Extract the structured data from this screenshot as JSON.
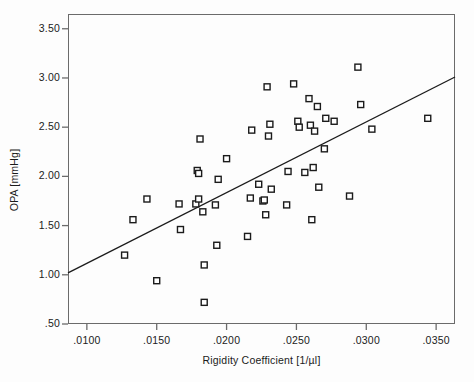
{
  "chart_data": {
    "type": "scatter",
    "title": "",
    "xlabel": "Rigidity Coefficient [1/µl]",
    "ylabel": "OPA [mmHg]",
    "xlim": [
      0.00865,
      0.03635
    ],
    "ylim": [
      0.5,
      3.65
    ],
    "xticks": [
      0.01,
      0.015,
      0.02,
      0.025,
      0.03,
      0.035
    ],
    "xtick_labels": [
      ".0100",
      ".0150",
      ".0200",
      ".0250",
      ".0300",
      ".0350"
    ],
    "yticks": [
      0.5,
      1.0,
      1.5,
      2.0,
      2.5,
      3.0,
      3.5
    ],
    "ytick_labels": [
      ".50",
      "1.00",
      "1.50",
      "2.00",
      "2.50",
      "3.00",
      "3.50"
    ],
    "grid": false,
    "legend": null,
    "marker": {
      "shape": "square-open",
      "size": 6,
      "edge_color": "#1b1b1b",
      "face_color": "#ffffff"
    },
    "points": [
      {
        "x": 0.0127,
        "y": 1.2
      },
      {
        "x": 0.0133,
        "y": 1.56
      },
      {
        "x": 0.0143,
        "y": 1.77
      },
      {
        "x": 0.015,
        "y": 0.94
      },
      {
        "x": 0.0166,
        "y": 1.72
      },
      {
        "x": 0.0167,
        "y": 1.46
      },
      {
        "x": 0.0178,
        "y": 1.72
      },
      {
        "x": 0.0179,
        "y": 2.06
      },
      {
        "x": 0.018,
        "y": 2.03
      },
      {
        "x": 0.018,
        "y": 1.77
      },
      {
        "x": 0.0181,
        "y": 2.38
      },
      {
        "x": 0.0183,
        "y": 1.64
      },
      {
        "x": 0.0184,
        "y": 1.1
      },
      {
        "x": 0.0184,
        "y": 0.72
      },
      {
        "x": 0.0192,
        "y": 1.71
      },
      {
        "x": 0.0193,
        "y": 1.3
      },
      {
        "x": 0.0194,
        "y": 1.97
      },
      {
        "x": 0.02,
        "y": 2.18
      },
      {
        "x": 0.0215,
        "y": 1.39
      },
      {
        "x": 0.0217,
        "y": 1.78
      },
      {
        "x": 0.0218,
        "y": 2.47
      },
      {
        "x": 0.0223,
        "y": 1.92
      },
      {
        "x": 0.0226,
        "y": 1.75
      },
      {
        "x": 0.0227,
        "y": 1.76
      },
      {
        "x": 0.0228,
        "y": 1.61
      },
      {
        "x": 0.0229,
        "y": 2.91
      },
      {
        "x": 0.023,
        "y": 2.41
      },
      {
        "x": 0.0231,
        "y": 2.53
      },
      {
        "x": 0.0232,
        "y": 1.87
      },
      {
        "x": 0.0243,
        "y": 1.71
      },
      {
        "x": 0.0244,
        "y": 2.05
      },
      {
        "x": 0.0248,
        "y": 2.94
      },
      {
        "x": 0.0251,
        "y": 2.56
      },
      {
        "x": 0.0252,
        "y": 2.5
      },
      {
        "x": 0.0256,
        "y": 2.04
      },
      {
        "x": 0.0259,
        "y": 2.79
      },
      {
        "x": 0.026,
        "y": 2.52
      },
      {
        "x": 0.0261,
        "y": 1.56
      },
      {
        "x": 0.0262,
        "y": 2.09
      },
      {
        "x": 0.0263,
        "y": 2.46
      },
      {
        "x": 0.0265,
        "y": 2.71
      },
      {
        "x": 0.0266,
        "y": 1.89
      },
      {
        "x": 0.027,
        "y": 2.28
      },
      {
        "x": 0.0271,
        "y": 2.59
      },
      {
        "x": 0.0277,
        "y": 2.56
      },
      {
        "x": 0.0288,
        "y": 1.8
      },
      {
        "x": 0.0294,
        "y": 3.11
      },
      {
        "x": 0.0296,
        "y": 2.73
      },
      {
        "x": 0.0304,
        "y": 2.48
      },
      {
        "x": 0.0344,
        "y": 2.59
      }
    ],
    "fit_line": {
      "type": "linear-regression",
      "x_start": 0.00865,
      "y_start": 1.02,
      "x_end": 0.03635,
      "y_end": 3.01,
      "color": "#1b1b1b"
    }
  }
}
